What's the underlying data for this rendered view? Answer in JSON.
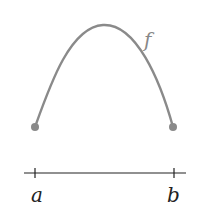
{
  "diagram": {
    "curve_label": "f",
    "left_label": "a",
    "right_label": "b",
    "colors": {
      "curve": "#8a8a8a",
      "axis": "#222222",
      "label_curve": "#888888",
      "label_axis": "#222222"
    }
  }
}
